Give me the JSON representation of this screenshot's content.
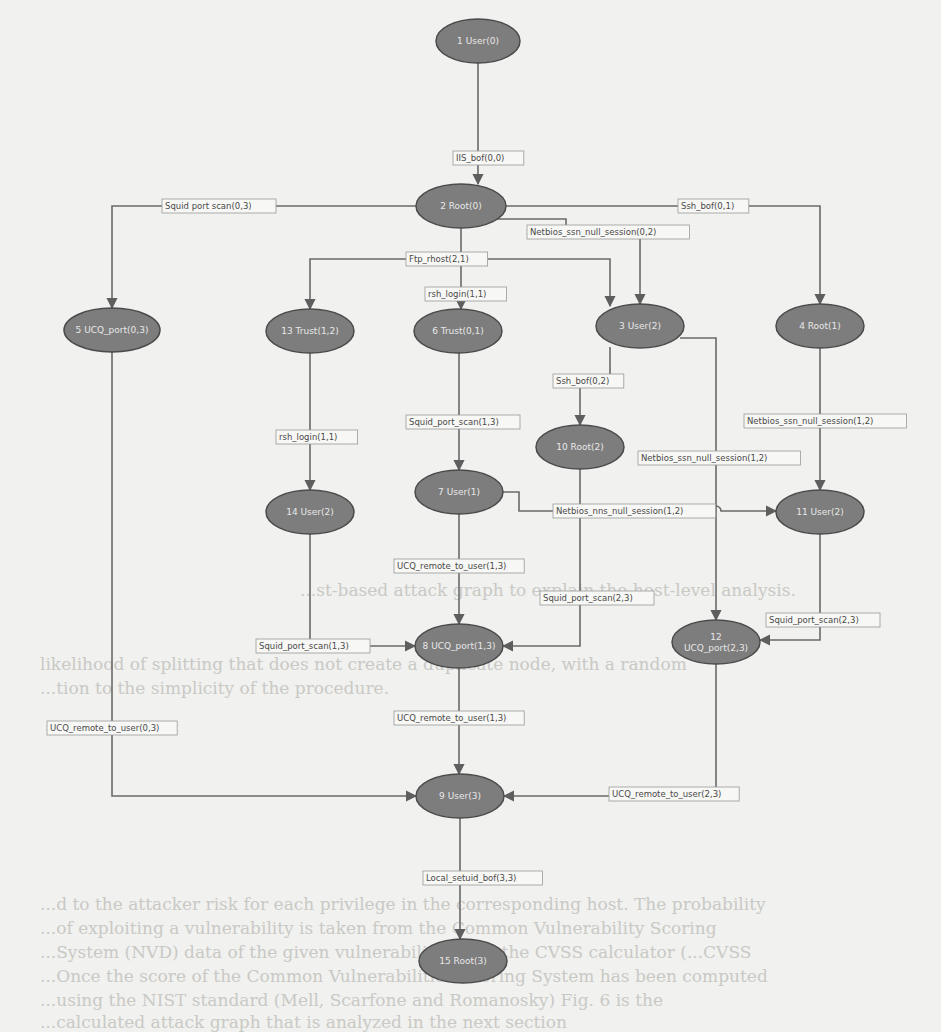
{
  "diagram": {
    "type": "attack-graph",
    "nodes": [
      {
        "id": "1",
        "label": "1 User(0)",
        "x": 478,
        "y": 41,
        "rx": 42,
        "ry": 22
      },
      {
        "id": "2",
        "label": "2 Root(0)",
        "x": 461,
        "y": 206,
        "rx": 45,
        "ry": 22
      },
      {
        "id": "3",
        "label": "3 User(2)",
        "x": 640,
        "y": 326,
        "rx": 44,
        "ry": 22
      },
      {
        "id": "4",
        "label": "4 Root(1)",
        "x": 820,
        "y": 326,
        "rx": 44,
        "ry": 22
      },
      {
        "id": "5",
        "label": "5 UCQ_port(0,3)",
        "x": 112,
        "y": 330,
        "rx": 48,
        "ry": 22
      },
      {
        "id": "6",
        "label": "6 Trust(0,1)",
        "x": 458,
        "y": 331,
        "rx": 44,
        "ry": 22
      },
      {
        "id": "13",
        "label": "13 Trust(1,2)",
        "x": 310,
        "y": 331,
        "rx": 44,
        "ry": 22
      },
      {
        "id": "10",
        "label": "10 Root(2)",
        "x": 580,
        "y": 447,
        "rx": 44,
        "ry": 22
      },
      {
        "id": "7",
        "label": "7 User(1)",
        "x": 459,
        "y": 492,
        "rx": 44,
        "ry": 22
      },
      {
        "id": "14",
        "label": "14 User(2)",
        "x": 310,
        "y": 512,
        "rx": 44,
        "ry": 22
      },
      {
        "id": "11",
        "label": "11 User(2)",
        "x": 820,
        "y": 512,
        "rx": 44,
        "ry": 22
      },
      {
        "id": "8",
        "label": "8 UCQ_port(1,3)",
        "x": 459,
        "y": 646,
        "rx": 44,
        "ry": 22
      },
      {
        "id": "12",
        "label": "12\nUCQ_port(2,3)",
        "x": 716,
        "y": 642,
        "rx": 44,
        "ry": 22
      },
      {
        "id": "9",
        "label": "9 User(3)",
        "x": 460,
        "y": 796,
        "rx": 44,
        "ry": 22
      },
      {
        "id": "15",
        "label": "15 Root(3)",
        "x": 463,
        "y": 961,
        "rx": 44,
        "ry": 22
      }
    ],
    "edges": [
      {
        "from": "1",
        "to": "2",
        "label": "IIS_bof(0,0)",
        "path": "M478,63 L478,184",
        "lx": 453,
        "ly": 158
      },
      {
        "from": "2",
        "to": "5",
        "label": "Squid port scan(0,3)",
        "path": "M416,206 L112,206 L112,308",
        "lx": 162,
        "ly": 206,
        "plain": true
      },
      {
        "from": "2",
        "to": "4",
        "label": "Ssh_bof(0,1)",
        "path": "M506,206 L820,206 L820,304",
        "lx": 678,
        "ly": 206,
        "plain": true
      },
      {
        "from": "2",
        "to": "3",
        "label": "Netbios_ssn_null_session(0,2)",
        "path": "M497,219 L566,219 L566,232 L640,232 L640,304",
        "lx": 527,
        "ly": 232
      },
      {
        "from": "2",
        "to": "13",
        "label": "Ftp_rhost(2,1)",
        "path": "M461,228 L461,259 L310,259 L310,309",
        "lx": 406,
        "ly": 259,
        "plain": true
      },
      {
        "from": "2",
        "to": "3",
        "label": "",
        "path": "M461,259 L610,259 L610,306",
        "lx": 0,
        "ly": 0
      },
      {
        "from": "2",
        "to": "6",
        "label": "rsh_login(1,1)",
        "path": "M461,259 L461,309",
        "lx": 425,
        "ly": 294
      },
      {
        "from": "3",
        "to": "10",
        "label": "Ssh_bof(0,2)",
        "path": "M610,347 L610,375 L580,375 L580,425",
        "lx": 553,
        "ly": 381
      },
      {
        "from": "3",
        "to": "12",
        "label": "Netbios_ssn_null_session(1,2)",
        "path": "M680,338 L716,338 L716,620",
        "lx": 638,
        "ly": 458
      },
      {
        "from": "4",
        "to": "11",
        "label": "Netbios_ssn_null_session(1,2)",
        "path": "M820,348 L820,490",
        "lx": 744,
        "ly": 421
      },
      {
        "from": "6",
        "to": "7",
        "label": "Squid_port_scan(1,3)",
        "path": "M459,353 L459,470",
        "lx": 406,
        "ly": 422
      },
      {
        "from": "13",
        "to": "14",
        "label": "rsh_login(1,1)",
        "path": "M310,353 L310,490",
        "lx": 276,
        "ly": 437
      },
      {
        "from": "7",
        "to": "11",
        "label": "Netbios_nns_null_session(1,2)",
        "path": "M503,492 L519,492 L519,511 L711,511 A5,5 0 0 1 721,511 L776,511",
        "lx": 553,
        "ly": 511
      },
      {
        "from": "10",
        "to": "8",
        "label": "Squid_port_scan(2,3)",
        "path": "M580,469 L580,646 L503,646",
        "lx": 540,
        "ly": 598
      },
      {
        "from": "7",
        "to": "8",
        "label": "UCQ_remote_to_user(1,3)",
        "path": "M459,514 L459,624",
        "lx": 394,
        "ly": 566
      },
      {
        "from": "14",
        "to": "8",
        "label": "Squid_port_scan(1,3)",
        "path": "M310,534 L310,646 L415,646",
        "lx": 256,
        "ly": 646,
        "plain": true
      },
      {
        "from": "11",
        "to": "12",
        "label": "Squid_port_scan(2,3)",
        "path": "M820,534 L820,640 L760,640",
        "lx": 766,
        "ly": 620
      },
      {
        "from": "5",
        "to": "9",
        "label": "UCQ_remote_to_user(0,3)",
        "path": "M112,352 L112,796 L416,796",
        "lx": 47,
        "ly": 728,
        "plain": true
      },
      {
        "from": "8",
        "to": "9",
        "label": "UCQ_remote_to_user(1,3)",
        "path": "M459,668 L459,774",
        "lx": 394,
        "ly": 718
      },
      {
        "from": "12",
        "to": "9",
        "label": "UCQ_remote_to_user(2,3)",
        "path": "M716,664 L716,796 L504,796",
        "lx": 609,
        "ly": 794
      },
      {
        "from": "9",
        "to": "15",
        "label": "Local_setuid_bof(3,3)",
        "path": "M460,818 L460,939",
        "lx": 423,
        "ly": 878
      }
    ]
  },
  "background_text": [
    {
      "text": "...st-based attack graph to explain the host-level analysis.",
      "x": 300,
      "y": 596
    },
    {
      "text": "likelihood of splitting that does not create a duplicate node, with a random",
      "x": 40,
      "y": 670
    },
    {
      "text": "...tion to the simplicity of the procedure.",
      "x": 40,
      "y": 694
    },
    {
      "text": "...d to the attacker risk for each privilege in the corresponding host. The probability",
      "x": 40,
      "y": 910
    },
    {
      "text": "...of exploiting a vulnerability is taken from the Common Vulnerability Scoring",
      "x": 40,
      "y": 934
    },
    {
      "text": "...System (NVD) data of the given vulnerability using the CVSS calculator (...CVSS",
      "x": 40,
      "y": 958
    },
    {
      "text": "...Once the score of the Common Vulnerabilities Scoring System has been computed",
      "x": 40,
      "y": 982
    },
    {
      "text": "...using the NIST standard (Mell, Scarfone and Romanosky) Fig. 6 is the",
      "x": 40,
      "y": 1006
    },
    {
      "text": "...calculated attack graph that is analyzed in the next section",
      "x": 40,
      "y": 1028
    }
  ]
}
